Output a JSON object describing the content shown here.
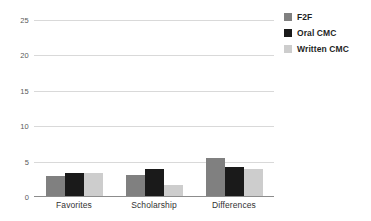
{
  "chart_data": {
    "type": "bar",
    "title": "",
    "xlabel": "",
    "ylabel": "",
    "categories": [
      "Favorites",
      "Scholarship",
      "Differences"
    ],
    "series": [
      {
        "name": "F2F",
        "color": "#808080",
        "values": [
          2.8,
          3.0,
          5.3
        ]
      },
      {
        "name": "Oral CMC",
        "color": "#1a1a1a",
        "values": [
          3.3,
          3.8,
          4.1
        ]
      },
      {
        "name": "Written CMC",
        "color": "#cdcdcd",
        "values": [
          3.2,
          1.5,
          3.8
        ]
      }
    ],
    "ylim": [
      0,
      25
    ],
    "yticks": [
      0,
      5,
      10,
      15,
      20,
      25
    ],
    "ytick_labels": [
      "0",
      "5",
      "10",
      "15",
      "20",
      "25"
    ],
    "grid": true,
    "legend_position": "right-top"
  },
  "legend": {
    "items": [
      {
        "label": "F2F"
      },
      {
        "label": "Oral CMC"
      },
      {
        "label": "Written CMC"
      }
    ]
  }
}
